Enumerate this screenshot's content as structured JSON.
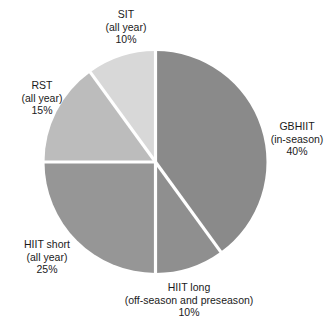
{
  "chart_data": {
    "type": "pie",
    "title": "",
    "subtitle": "",
    "xlabel": "",
    "ylabel": "",
    "grid": false,
    "legend_position": "none",
    "labels_position": "outside",
    "start_angle_deg": 0,
    "direction": "clockwise",
    "categories": [
      "GBHIIT",
      "HIIT long",
      "HIIT short",
      "RST",
      "SIT"
    ],
    "values": [
      40,
      10,
      25,
      15,
      10
    ],
    "units": "%",
    "slices": [
      {
        "name": "GBHIIT",
        "sub": "(in-season)",
        "percent": 40,
        "percent_label": "40%",
        "color": "#8a8a8a",
        "start_deg": 0,
        "end_deg": 144
      },
      {
        "name": "HIIT long",
        "sub": "(off-season and preseason)",
        "percent": 10,
        "percent_label": "10%",
        "color": "#8f8f8f",
        "start_deg": 144,
        "end_deg": 180
      },
      {
        "name": "HIIT short",
        "sub": "(all year)",
        "percent": 25,
        "percent_label": "25%",
        "color": "#969696",
        "start_deg": 180,
        "end_deg": 270
      },
      {
        "name": "RST",
        "sub": "(all year)",
        "percent": 15,
        "percent_label": "15%",
        "color": "#bcbcbc",
        "start_deg": 270,
        "end_deg": 324
      },
      {
        "name": "SIT",
        "sub": "(all year)",
        "percent": 10,
        "percent_label": "10%",
        "color": "#d8d8d8",
        "start_deg": 324,
        "end_deg": 360
      }
    ],
    "separator_color": "#ffffff",
    "background_color": "#ffffff"
  },
  "labels": {
    "sit": {
      "name": "SIT",
      "sub": "(all year)",
      "percent": "10%"
    },
    "rst": {
      "name": "RST",
      "sub": "(all year)",
      "percent": "15%"
    },
    "gbhiit": {
      "name": "GBHIIT",
      "sub": "(in-season)",
      "percent": "40%"
    },
    "hiit_short": {
      "name": "HIIT short",
      "sub": "(all year)",
      "percent": "25%"
    },
    "hiit_long": {
      "name": "HIIT long",
      "sub": "(off-season and preseason)",
      "percent": "10%"
    }
  }
}
